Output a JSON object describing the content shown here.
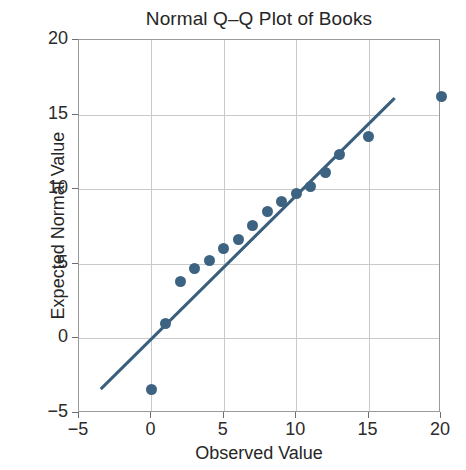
{
  "chart_data": {
    "type": "scatter",
    "title": "Normal Q–Q Plot of Books",
    "xlabel": "Observed Value",
    "ylabel": "Expected Normal Value",
    "xlim": [
      -5,
      20
    ],
    "ylim": [
      -5,
      20
    ],
    "xticks": [
      -5,
      0,
      5,
      10,
      15,
      20
    ],
    "yticks": [
      -5,
      0,
      5,
      10,
      15,
      20
    ],
    "xtick_labels": [
      "−5",
      "0",
      "5",
      "10",
      "15",
      "20"
    ],
    "ytick_labels": [
      "−5",
      "0",
      "5",
      "10",
      "15",
      "20"
    ],
    "grid": true,
    "legend": "none",
    "marker_color": "#3d6382",
    "line_color": "#3a5f7d",
    "grid_color": "#c9c9c9",
    "frame_color": "#9a9a9a",
    "series": [
      {
        "name": "Q-Q points",
        "x": [
          0,
          1,
          2,
          3,
          4,
          5,
          6,
          7,
          8,
          9,
          10,
          11,
          12,
          13,
          15,
          20
        ],
        "y": [
          -3.4,
          1.0,
          3.8,
          4.7,
          5.2,
          6.0,
          6.6,
          7.6,
          8.5,
          9.2,
          9.7,
          10.2,
          11.1,
          12.3,
          13.5,
          16.2
        ]
      }
    ],
    "reference_line": {
      "name": "normal reference line",
      "x": [
        -3.5,
        16.8
      ],
      "y": [
        -3.4,
        16.1
      ]
    }
  }
}
